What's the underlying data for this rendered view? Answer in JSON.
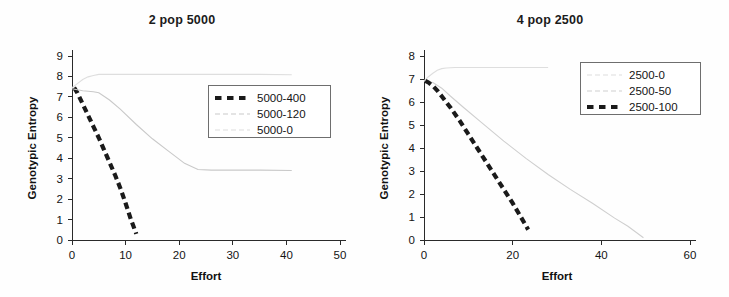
{
  "figure": {
    "background_color": "#fefefe",
    "panels": [
      "left",
      "right"
    ]
  },
  "left": {
    "title": "2 pop 5000",
    "xlabel": "Effort",
    "ylabel": "Genotypic Entropy",
    "legend": {
      "items": [
        {
          "label": "5000-400",
          "style": "thick-dashed",
          "color": "#1a1a1a"
        },
        {
          "label": "5000-120",
          "style": "thin-solid",
          "color": "#c9c9c9"
        },
        {
          "label": "5000-0",
          "style": "thin-solid",
          "color": "#dedede"
        }
      ]
    },
    "xticks": [
      "0",
      "10",
      "20",
      "30",
      "40",
      "50"
    ],
    "yticks": [
      "0",
      "1",
      "2",
      "3",
      "4",
      "5",
      "6",
      "7",
      "8",
      "9"
    ]
  },
  "right": {
    "title": "4 pop 2500",
    "xlabel": "Effort",
    "ylabel": "Genotypic Entropy",
    "legend": {
      "items": [
        {
          "label": "2500-0",
          "style": "thin-solid",
          "color": "#dedede"
        },
        {
          "label": "2500-50",
          "style": "thin-solid",
          "color": "#cfcfcf"
        },
        {
          "label": "2500-100",
          "style": "thick-dashed",
          "color": "#1a1a1a"
        }
      ]
    },
    "xticks": [
      "0",
      "20",
      "40",
      "60"
    ],
    "yticks": [
      "0",
      "1",
      "2",
      "3",
      "4",
      "5",
      "6",
      "7",
      "8"
    ]
  },
  "chart_data": [
    {
      "type": "line",
      "title": "2 pop 5000",
      "xlabel": "Effort",
      "ylabel": "Genotypic Entropy",
      "xlim": [
        0,
        50
      ],
      "ylim": [
        0,
        9
      ],
      "xticks": [
        0,
        10,
        20,
        30,
        40,
        50
      ],
      "yticks": [
        0,
        1,
        2,
        3,
        4,
        5,
        6,
        7,
        8,
        9
      ],
      "grid": false,
      "legend_position": "upper-right-inside",
      "series": [
        {
          "name": "5000-400",
          "style": "thick-dashed",
          "color": "#1a1a1a",
          "x": [
            0.4,
            1.0,
            2.0,
            3.0,
            4.0,
            5.0,
            6.0,
            7.0,
            8.0,
            9.0,
            10.0,
            11.0,
            12.0
          ],
          "y": [
            7.45,
            7.2,
            6.65,
            6.1,
            5.55,
            5.0,
            4.4,
            3.8,
            3.2,
            2.55,
            1.8,
            1.0,
            0.3
          ]
        },
        {
          "name": "5000-120",
          "style": "thin-solid",
          "color": "#c9c9c9",
          "x": [
            0.0,
            2.0,
            4.0,
            5.0,
            7.0,
            9.0,
            12.0,
            15.0,
            18.0,
            21.0,
            23.5,
            26.0,
            30.0,
            35.0,
            41.0
          ],
          "y": [
            7.4,
            7.3,
            7.25,
            7.2,
            6.85,
            6.4,
            5.65,
            4.95,
            4.35,
            3.75,
            3.45,
            3.42,
            3.42,
            3.42,
            3.4
          ]
        },
        {
          "name": "5000-0",
          "style": "thin-solid",
          "color": "#dedede",
          "x": [
            0.0,
            1.0,
            2.0,
            3.0,
            4.0,
            5.0,
            7.0,
            10.0,
            15.0,
            20.0,
            25.0,
            30.0,
            35.0,
            41.0
          ],
          "y": [
            7.45,
            7.65,
            7.85,
            7.98,
            8.05,
            8.1,
            8.1,
            8.1,
            8.1,
            8.1,
            8.1,
            8.1,
            8.1,
            8.08
          ]
        }
      ]
    },
    {
      "type": "line",
      "title": "4 pop 2500",
      "xlabel": "Effort",
      "ylabel": "Genotypic Entropy",
      "xlim": [
        0,
        60
      ],
      "ylim": [
        0,
        8
      ],
      "xticks": [
        0,
        20,
        40,
        60
      ],
      "yticks": [
        0,
        1,
        2,
        3,
        4,
        5,
        6,
        7,
        8
      ],
      "grid": false,
      "legend_position": "upper-right-inside",
      "series": [
        {
          "name": "2500-0",
          "style": "thin-solid",
          "color": "#dedede",
          "x": [
            0.0,
            1.0,
            2.0,
            3.0,
            4.0,
            5.0,
            7.0,
            10.0,
            15.0,
            20.0,
            25.0,
            28.0
          ],
          "y": [
            6.92,
            7.1,
            7.25,
            7.38,
            7.45,
            7.48,
            7.5,
            7.5,
            7.5,
            7.5,
            7.5,
            7.5
          ]
        },
        {
          "name": "2500-50",
          "style": "thin-solid",
          "color": "#cfcfcf",
          "x": [
            0.0,
            2.0,
            4.0,
            6.0,
            9.0,
            13.0,
            18.0,
            23.0,
            28.0,
            33.0,
            38.0,
            43.0,
            46.0,
            49.5
          ],
          "y": [
            6.92,
            6.85,
            6.6,
            6.25,
            5.75,
            5.1,
            4.3,
            3.55,
            2.85,
            2.2,
            1.6,
            0.95,
            0.6,
            0.1
          ]
        },
        {
          "name": "2500-100",
          "style": "thick-dashed",
          "color": "#1a1a1a",
          "x": [
            0.3,
            1.0,
            2.0,
            3.0,
            4.0,
            6.0,
            8.0,
            10.0,
            12.0,
            14.0,
            16.0,
            18.0,
            20.0,
            22.0,
            23.5
          ],
          "y": [
            6.92,
            6.85,
            6.7,
            6.5,
            6.25,
            5.75,
            5.2,
            4.6,
            4.0,
            3.4,
            2.8,
            2.2,
            1.6,
            0.95,
            0.45
          ]
        }
      ]
    }
  ]
}
